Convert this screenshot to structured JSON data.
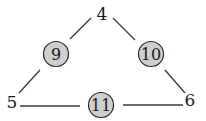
{
  "diagram": {
    "type": "magic-triangle",
    "colors": {
      "line": "#3a3a3a",
      "circle_fill": "#cfcfcf",
      "circle_stroke": "#2a2a2a",
      "text": "#1a1a1a",
      "background": "#ffffff"
    },
    "corner_nodes": [
      {
        "id": "top",
        "label": "4"
      },
      {
        "id": "bottom-left",
        "label": "5"
      },
      {
        "id": "bottom-right",
        "label": "6"
      }
    ],
    "edge_nodes": [
      {
        "id": "left-edge",
        "label": "9"
      },
      {
        "id": "right-edge",
        "label": "10"
      },
      {
        "id": "bottom-edge",
        "label": "11"
      }
    ]
  }
}
